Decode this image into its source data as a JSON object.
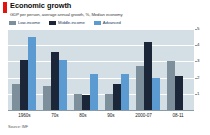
{
  "header": {
    "title": "Economic growth",
    "subtitle": "GDP per person, average annual growth, %, Median economy",
    "tab_marker_color": "#e3120b"
  },
  "legend": {
    "position": "top-left",
    "items": [
      {
        "label": "Low-income",
        "color": "#7e8f9c"
      },
      {
        "label": "Middle-income",
        "color": "#1b2738"
      },
      {
        "label": "Advanced",
        "color": "#5b9bd1"
      }
    ]
  },
  "source": {
    "text": "Source: IMF"
  },
  "axis": {
    "y_ticks": [
      "5",
      "4",
      "3",
      "2",
      "1"
    ],
    "plot_background": "#d3dee5",
    "gridline_color": "#ffffff"
  },
  "chart_data": {
    "type": "bar",
    "title": "Economic growth",
    "subtitle": "GDP per person, average annual growth, %, Median economy",
    "xlabel": "",
    "ylabel": "%",
    "ylim": [
      0,
      5
    ],
    "yticks": [
      1,
      2,
      3,
      4,
      5
    ],
    "grid": true,
    "legend_position": "top-left",
    "source": "Source: IMF",
    "categories": [
      "1960s",
      "70s",
      "80s",
      "90s",
      "2000-07",
      "08-11"
    ],
    "series": [
      {
        "name": "Low-income",
        "color": "#7e8f9c",
        "values": [
          1.6,
          1.5,
          1.0,
          1.0,
          2.7,
          3.0
        ]
      },
      {
        "name": "Middle-income",
        "color": "#1b2738",
        "values": [
          3.1,
          3.6,
          0.95,
          1.6,
          4.2,
          2.1
        ]
      },
      {
        "name": "Advanced",
        "color": "#5b9bd1",
        "values": [
          4.5,
          3.1,
          2.2,
          2.2,
          2.0,
          0.0
        ]
      }
    ]
  }
}
